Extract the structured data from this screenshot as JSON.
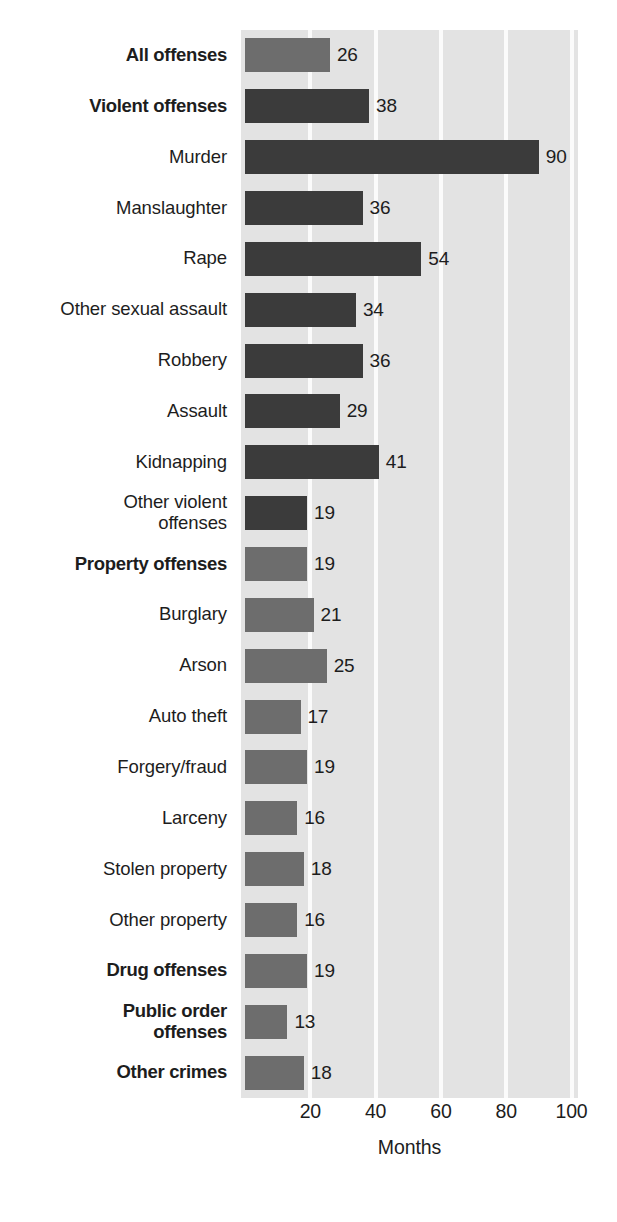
{
  "chart_data": {
    "type": "bar",
    "orientation": "horizontal",
    "title": "",
    "xlabel": "Months",
    "ylabel": "",
    "xlim": [
      0,
      105
    ],
    "xticks": [
      20,
      40,
      60,
      80,
      100
    ],
    "xtick_labels": [
      "20",
      "40",
      "60",
      "80",
      "100"
    ],
    "grid": "vertical-white-gridlines",
    "legend": "none",
    "categories": [
      "All offenses",
      "Violent offenses",
      "Murder",
      "Manslaughter",
      "Rape",
      "Other sexual assault",
      "Robbery",
      "Assault",
      "Kidnapping",
      "Other violent offenses",
      "Property offenses",
      "Burglary",
      "Arson",
      "Auto theft",
      "Forgery/fraud",
      "Larceny",
      "Stolen property",
      "Other property",
      "Drug offenses",
      "Public order offenses",
      "Other crimes"
    ],
    "values": [
      26,
      38,
      90,
      36,
      54,
      34,
      36,
      29,
      41,
      19,
      19,
      21,
      25,
      17,
      19,
      16,
      18,
      16,
      19,
      13,
      18
    ],
    "bars": [
      {
        "label": "All offenses",
        "label_lines": [
          "All offenses"
        ],
        "value": 26,
        "shade": "mid",
        "bold": true
      },
      {
        "label": "Violent offenses",
        "label_lines": [
          "Violent offenses"
        ],
        "value": 38,
        "shade": "dark",
        "bold": true
      },
      {
        "label": "Murder",
        "label_lines": [
          "Murder"
        ],
        "value": 90,
        "shade": "dark",
        "bold": false
      },
      {
        "label": "Manslaughter",
        "label_lines": [
          "Manslaughter"
        ],
        "value": 36,
        "shade": "dark",
        "bold": false
      },
      {
        "label": "Rape",
        "label_lines": [
          "Rape"
        ],
        "value": 54,
        "shade": "dark",
        "bold": false
      },
      {
        "label": "Other sexual assault",
        "label_lines": [
          "Other sexual assault"
        ],
        "value": 34,
        "shade": "dark",
        "bold": false
      },
      {
        "label": "Robbery",
        "label_lines": [
          "Robbery"
        ],
        "value": 36,
        "shade": "dark",
        "bold": false
      },
      {
        "label": "Assault",
        "label_lines": [
          "Assault"
        ],
        "value": 29,
        "shade": "dark",
        "bold": false
      },
      {
        "label": "Kidnapping",
        "label_lines": [
          "Kidnapping"
        ],
        "value": 41,
        "shade": "dark",
        "bold": false
      },
      {
        "label": "Other violent offenses",
        "label_lines": [
          "Other violent",
          "offenses"
        ],
        "value": 19,
        "shade": "dark",
        "bold": false
      },
      {
        "label": "Property offenses",
        "label_lines": [
          "Property offenses"
        ],
        "value": 19,
        "shade": "mid",
        "bold": true
      },
      {
        "label": "Burglary",
        "label_lines": [
          "Burglary"
        ],
        "value": 21,
        "shade": "mid",
        "bold": false
      },
      {
        "label": "Arson",
        "label_lines": [
          "Arson"
        ],
        "value": 25,
        "shade": "mid",
        "bold": false
      },
      {
        "label": "Auto theft",
        "label_lines": [
          "Auto theft"
        ],
        "value": 17,
        "shade": "mid",
        "bold": false
      },
      {
        "label": "Forgery/fraud",
        "label_lines": [
          "Forgery/fraud"
        ],
        "value": 19,
        "shade": "mid",
        "bold": false
      },
      {
        "label": "Larceny",
        "label_lines": [
          "Larceny"
        ],
        "value": 16,
        "shade": "mid",
        "bold": false
      },
      {
        "label": "Stolen property",
        "label_lines": [
          "Stolen property"
        ],
        "value": 18,
        "shade": "mid",
        "bold": false
      },
      {
        "label": "Other property",
        "label_lines": [
          "Other property"
        ],
        "value": 16,
        "shade": "mid",
        "bold": false
      },
      {
        "label": "Drug offenses",
        "label_lines": [
          "Drug offenses"
        ],
        "value": 19,
        "shade": "mid",
        "bold": true
      },
      {
        "label": "Public order offenses",
        "label_lines": [
          "Public order",
          "offenses"
        ],
        "value": 13,
        "shade": "mid",
        "bold": true
      },
      {
        "label": "Other crimes",
        "label_lines": [
          "Other crimes"
        ],
        "value": 18,
        "shade": "mid",
        "bold": true
      }
    ],
    "colors": {
      "bar_dark": "#3b3b3b",
      "bar_mid": "#6d6d6d",
      "plot_background": "#e3e3e3",
      "gridline": "#fbfbfb",
      "text": "#1d1d1d",
      "page_background": "#ffffff"
    }
  }
}
